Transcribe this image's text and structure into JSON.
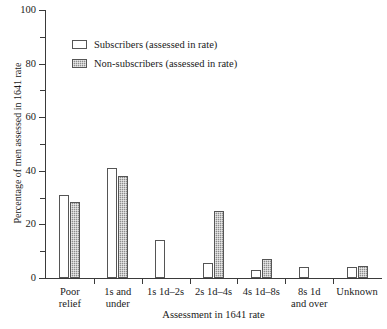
{
  "chart_data": {
    "type": "bar",
    "title": "",
    "xlabel": "Assessment in 1641 rate",
    "ylabel": "Percentage of men assessed in 1641 rate",
    "ylim": [
      0,
      100
    ],
    "ymajor_ticks": [
      0,
      20,
      40,
      60,
      80,
      100
    ],
    "yminor_ticks": [
      10,
      30,
      50,
      70,
      90
    ],
    "grid": false,
    "legend_position": "upper-left-inside",
    "categories": [
      "Poor\nrelief",
      "1s and\nunder",
      "1s 1d–2s",
      "2s 1d–4s",
      "4s 1d–8s",
      "8s 1d\nand over",
      "Unknown"
    ],
    "series": [
      {
        "name": "Subscribers (assessed in rate)",
        "fill": "white",
        "values": [
          31,
          41,
          14,
          5.5,
          3,
          4,
          4
        ]
      },
      {
        "name": "Non-subscribers (assessed in rate)",
        "fill": "gray-stipple",
        "values": [
          28.5,
          38,
          0,
          25,
          7,
          0,
          4.5
        ]
      }
    ]
  },
  "axis": {
    "y_tick_labels": [
      "0",
      "20",
      "40",
      "60",
      "80",
      "100"
    ],
    "y_title": "Percentage of men assessed in 1641 rate",
    "x_title": "Assessment in 1641 rate"
  },
  "legend": {
    "entries": [
      {
        "label": "Subscribers (assessed in rate)"
      },
      {
        "label": "Non-subscribers (assessed in rate)"
      }
    ]
  },
  "colors": {
    "axis": "#3a3a3a",
    "bar_outline": "#555555",
    "subscribers_fill": "#ffffff",
    "non_subscribers_fill": "#8c8c8c",
    "background": "#ffffff",
    "text": "#1a1a1a"
  }
}
